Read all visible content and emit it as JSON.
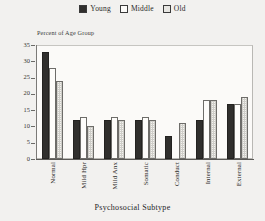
{
  "chart_data": {
    "type": "bar",
    "title": "",
    "xlabel": "Psychosocial Subtype",
    "ylabel": "Percent of Age Group",
    "categories": [
      "Normal",
      "Mild Hpr",
      "Mild Anx",
      "Somatic",
      "Conduct",
      "Internal",
      "External"
    ],
    "series": [
      {
        "name": "Young",
        "values": [
          33,
          12,
          12,
          12,
          7,
          12,
          17
        ]
      },
      {
        "name": "Middle",
        "values": [
          28,
          13,
          13,
          13,
          0,
          18,
          17
        ]
      },
      {
        "name": "Old",
        "values": [
          24,
          10,
          12,
          12,
          11,
          18,
          19
        ]
      }
    ],
    "ylim": [
      0,
      35
    ],
    "yticks": [
      0,
      5,
      10,
      15,
      20,
      25,
      30,
      35
    ],
    "ytick_labels": [
      "0",
      "5",
      "10",
      "15",
      "20",
      "25",
      "30",
      "35"
    ],
    "grid": false,
    "legend_position": "top-center",
    "series_styles": [
      "filled-black",
      "open-white",
      "light-hatched"
    ]
  },
  "legend": {
    "items": [
      {
        "label": "Young",
        "swatch": "legend-swatch-young"
      },
      {
        "label": "Middle",
        "swatch": "legend-swatch-middle"
      },
      {
        "label": "Old",
        "swatch": "legend-swatch-old"
      }
    ]
  }
}
